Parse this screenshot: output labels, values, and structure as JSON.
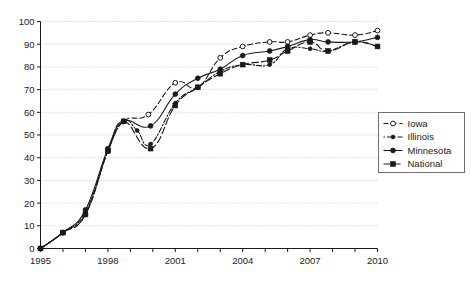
{
  "chart_data": {
    "type": "line",
    "title": "",
    "subtitle": "",
    "xlabel": "",
    "ylabel": "",
    "xlim": [
      1995,
      2010
    ],
    "ylim": [
      0,
      100
    ],
    "xticks": [
      1995,
      1998,
      2001,
      2004,
      2007,
      2010
    ],
    "xtick_labels": [
      "1995",
      "1998",
      "2001",
      "2004",
      "2007",
      "2010"
    ],
    "yticks": [
      0,
      10,
      20,
      30,
      40,
      50,
      60,
      70,
      80,
      90,
      100
    ],
    "ytick_labels": [
      "0",
      "10",
      "20",
      "30",
      "40",
      "50",
      "60",
      "70",
      "80",
      "90",
      "100"
    ],
    "grid": "horizontal-dotted",
    "legend_position": "right-middle",
    "series": [
      {
        "name": "Iowa",
        "marker": "open-circle",
        "line_style": "dashed",
        "color": "#1a1a1a",
        "points": [
          {
            "x": 1995.0,
            "y": 0
          },
          {
            "x": 1996.0,
            "y": 7
          },
          {
            "x": 1997.0,
            "y": 15
          },
          {
            "x": 1998.0,
            "y": 43
          },
          {
            "x": 1998.7,
            "y": 56
          },
          {
            "x": 1999.8,
            "y": 59
          },
          {
            "x": 2001.0,
            "y": 73
          },
          {
            "x": 2002.0,
            "y": 71
          },
          {
            "x": 2003.0,
            "y": 84
          },
          {
            "x": 2004.0,
            "y": 89
          },
          {
            "x": 2005.2,
            "y": 91
          },
          {
            "x": 2006.0,
            "y": 91
          },
          {
            "x": 2007.0,
            "y": 94
          },
          {
            "x": 2007.8,
            "y": 95
          },
          {
            "x": 2009.0,
            "y": 94
          },
          {
            "x": 2010.0,
            "y": 96
          }
        ]
      },
      {
        "name": "Illinois",
        "marker": "small-filled-circle",
        "line_style": "dash-dot",
        "color": "#1a1a1a",
        "points": [
          {
            "x": 1995.0,
            "y": 0
          },
          {
            "x": 1996.0,
            "y": 7
          },
          {
            "x": 1997.0,
            "y": 16
          },
          {
            "x": 1998.0,
            "y": 43
          },
          {
            "x": 1998.7,
            "y": 56
          },
          {
            "x": 1999.3,
            "y": 52
          },
          {
            "x": 1999.9,
            "y": 46
          },
          {
            "x": 2001.0,
            "y": 64
          },
          {
            "x": 2002.0,
            "y": 71
          },
          {
            "x": 2003.0,
            "y": 78
          },
          {
            "x": 2004.0,
            "y": 81
          },
          {
            "x": 2005.2,
            "y": 81
          },
          {
            "x": 2006.0,
            "y": 88
          },
          {
            "x": 2007.0,
            "y": 88
          },
          {
            "x": 2007.8,
            "y": 87
          },
          {
            "x": 2009.0,
            "y": 91
          },
          {
            "x": 2010.0,
            "y": 89
          }
        ]
      },
      {
        "name": "Minnesota",
        "marker": "filled-circle",
        "line_style": "solid",
        "color": "#1a1a1a",
        "points": [
          {
            "x": 1995.0,
            "y": 0
          },
          {
            "x": 1996.0,
            "y": 7
          },
          {
            "x": 1997.0,
            "y": 17
          },
          {
            "x": 1998.0,
            "y": 44
          },
          {
            "x": 1998.7,
            "y": 56
          },
          {
            "x": 1999.9,
            "y": 54
          },
          {
            "x": 2001.0,
            "y": 68
          },
          {
            "x": 2002.0,
            "y": 75
          },
          {
            "x": 2003.0,
            "y": 79
          },
          {
            "x": 2004.0,
            "y": 85
          },
          {
            "x": 2005.2,
            "y": 87
          },
          {
            "x": 2006.0,
            "y": 89
          },
          {
            "x": 2007.0,
            "y": 92
          },
          {
            "x": 2007.8,
            "y": 91
          },
          {
            "x": 2009.0,
            "y": 91
          },
          {
            "x": 2010.0,
            "y": 93
          }
        ]
      },
      {
        "name": "National",
        "marker": "filled-square",
        "line_style": "long-dash",
        "color": "#1a1a1a",
        "points": [
          {
            "x": 1995.0,
            "y": 0
          },
          {
            "x": 1996.0,
            "y": 7
          },
          {
            "x": 1997.0,
            "y": 15
          },
          {
            "x": 1998.0,
            "y": 43
          },
          {
            "x": 1998.7,
            "y": 56
          },
          {
            "x": 1999.9,
            "y": 44
          },
          {
            "x": 2001.0,
            "y": 63
          },
          {
            "x": 2002.0,
            "y": 71
          },
          {
            "x": 2003.0,
            "y": 77
          },
          {
            "x": 2004.0,
            "y": 81
          },
          {
            "x": 2005.2,
            "y": 83
          },
          {
            "x": 2006.0,
            "y": 87
          },
          {
            "x": 2007.0,
            "y": 91
          },
          {
            "x": 2007.8,
            "y": 87
          },
          {
            "x": 2009.0,
            "y": 91
          },
          {
            "x": 2010.0,
            "y": 89
          }
        ]
      }
    ]
  },
  "legend": {
    "entries": [
      {
        "label": "Iowa"
      },
      {
        "label": "Illinois"
      },
      {
        "label": "Minnesota"
      },
      {
        "label": "National"
      }
    ]
  }
}
